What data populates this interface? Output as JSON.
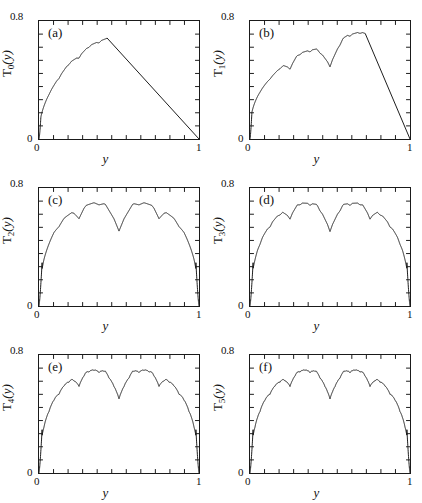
{
  "figure": {
    "width": 422,
    "height": 503,
    "background": "#ffffff",
    "line_color": "#1a1a1a",
    "rows": 3,
    "cols": 2
  },
  "chart_data": [
    {
      "type": "line",
      "panel_tag": "(a)",
      "title": "",
      "xlabel": "y",
      "ylabel": "T_0(y)",
      "ylabel_base": "T",
      "ylabel_sub": "0",
      "ylabel_suffix": "(y)",
      "xlim": [
        0,
        1
      ],
      "ylim": [
        0,
        0.8
      ],
      "xticklabels": [
        "0",
        "1"
      ],
      "yticklabels": [
        "0.8",
        "0"
      ],
      "xtick_count": 11,
      "ytick_count": 9,
      "grid": false,
      "legend": null,
      "description": "Takagi-type fractal, iteration 0: rough rising edge peaking near y=0.42 at ~0.69 then straight descent to 0 at y=1",
      "x": [
        0.0,
        0.005,
        0.01,
        0.015,
        0.02,
        0.025,
        0.03,
        0.04,
        0.05,
        0.06,
        0.07,
        0.08,
        0.09,
        0.1,
        0.11,
        0.12,
        0.13,
        0.14,
        0.15,
        0.16,
        0.17,
        0.18,
        0.19,
        0.2,
        0.21,
        0.22,
        0.23,
        0.24,
        0.25,
        0.26,
        0.27,
        0.28,
        0.29,
        0.3,
        0.31,
        0.32,
        0.33,
        0.34,
        0.35,
        0.36,
        0.37,
        0.38,
        0.39,
        0.4,
        0.41,
        0.42,
        0.43,
        0.44,
        0.45,
        0.5,
        0.55,
        0.6,
        0.65,
        0.7,
        0.75,
        0.8,
        0.85,
        0.9,
        0.95,
        1.0
      ],
      "y": [
        0.0,
        0.035,
        0.062,
        0.085,
        0.104,
        0.12,
        0.134,
        0.157,
        0.176,
        0.192,
        0.206,
        0.219,
        0.23,
        0.241,
        0.251,
        0.26,
        0.269,
        0.277,
        0.285,
        0.3,
        0.312,
        0.323,
        0.333,
        0.342,
        0.351,
        0.36,
        0.368,
        0.376,
        0.383,
        0.39,
        0.398,
        0.406,
        0.414,
        0.421,
        0.4,
        0.412,
        0.425,
        0.437,
        0.448,
        0.46,
        0.474,
        0.487,
        0.5,
        0.513,
        0.523,
        0.53,
        0.526,
        0.52,
        0.514,
        0.476,
        0.438,
        0.4,
        0.362,
        0.324,
        0.286,
        0.248,
        0.19,
        0.14,
        0.072,
        0.0
      ]
    },
    {
      "type": "line",
      "panel_tag": "(b)",
      "title": "",
      "xlabel": "y",
      "ylabel": "T_1(y)",
      "ylabel_base": "T",
      "ylabel_sub": "1",
      "ylabel_suffix": "(y)",
      "xlim": [
        0,
        1
      ],
      "ylim": [
        0,
        0.8
      ],
      "xticklabels": [
        "0",
        "1"
      ],
      "yticklabels": [
        "0.8",
        "0"
      ],
      "xtick_count": 11,
      "ytick_count": 9,
      "grid": false,
      "legend": null,
      "description": "Iteration 1: two broad humps reaching ~0.69 with central notch near y=0.5; straight descent from y~0.72 to 0 at y=1",
      "x": [
        0.0,
        0.01,
        0.02,
        0.03,
        0.04,
        0.05,
        0.06,
        0.07,
        0.08,
        0.09,
        0.1,
        0.12,
        0.14,
        0.15,
        0.16,
        0.18,
        0.2,
        0.22,
        0.24,
        0.25,
        0.26,
        0.28,
        0.3,
        0.32,
        0.34,
        0.35,
        0.36,
        0.38,
        0.4,
        0.42,
        0.44,
        0.45,
        0.46,
        0.48,
        0.5,
        0.52,
        0.54,
        0.55,
        0.56,
        0.58,
        0.6,
        0.62,
        0.64,
        0.65,
        0.66,
        0.68,
        0.7,
        0.72,
        0.75,
        0.8,
        0.85,
        0.9,
        0.95,
        1.0
      ],
      "y": [
        0.0,
        0.062,
        0.104,
        0.134,
        0.157,
        0.176,
        0.192,
        0.206,
        0.219,
        0.23,
        0.241,
        0.26,
        0.277,
        0.285,
        0.3,
        0.323,
        0.342,
        0.36,
        0.376,
        0.383,
        0.39,
        0.406,
        0.421,
        0.4,
        0.425,
        0.437,
        0.448,
        0.474,
        0.5,
        0.523,
        0.53,
        0.525,
        0.52,
        0.508,
        0.5,
        0.512,
        0.524,
        0.53,
        0.527,
        0.518,
        0.5,
        0.47,
        0.44,
        0.43,
        0.442,
        0.47,
        0.5,
        0.527,
        0.53,
        0.4,
        0.3,
        0.2,
        0.1,
        0.0
      ]
    },
    {
      "type": "line",
      "panel_tag": "(c)",
      "title": "",
      "xlabel": "y",
      "ylabel": "T_2(y)",
      "ylabel_base": "T",
      "ylabel_sub": "2",
      "ylabel_suffix": "(y)",
      "xlim": [
        0,
        1
      ],
      "ylim": [
        0,
        0.8
      ],
      "xticklabels": [
        "0",
        "1"
      ],
      "yticklabels": [
        "0.8",
        "0"
      ],
      "xtick_count": 11,
      "ytick_count": 9,
      "grid": false,
      "legend": null,
      "description": "Iteration 2: symmetric dome, two main lobes peaking ~0.69, sharp central V-notch at y=0.5, small serrations on shoulders",
      "x": [],
      "y": []
    },
    {
      "type": "line",
      "panel_tag": "(d)",
      "title": "",
      "xlabel": "y",
      "ylabel": "T_3(y)",
      "ylabel_base": "T",
      "ylabel_sub": "3",
      "ylabel_suffix": "(y)",
      "xlim": [
        0,
        1
      ],
      "ylim": [
        0,
        0.8
      ],
      "xticklabels": [
        "0",
        "1"
      ],
      "yticklabels": [
        "0.8",
        "0"
      ],
      "xtick_count": 11,
      "ytick_count": 9,
      "grid": false,
      "legend": null,
      "description": "Iteration 3: symmetric dome with finer self-similar serration, central notch at y=0.5",
      "x": [],
      "y": []
    },
    {
      "type": "line",
      "panel_tag": "(e)",
      "title": "",
      "xlabel": "y",
      "ylabel": "T_4(y)",
      "ylabel_base": "T",
      "ylabel_sub": "4",
      "ylabel_suffix": "(y)",
      "xlim": [
        0,
        1
      ],
      "ylim": [
        0,
        0.8
      ],
      "xticklabels": [
        "0",
        "1"
      ],
      "yticklabels": [
        "0.8",
        "0"
      ],
      "xtick_count": 11,
      "ytick_count": 9,
      "grid": false,
      "legend": null,
      "description": "Iteration 4: converged symmetric fractal dome, peaks ~0.69, deep central notch",
      "x": [],
      "y": []
    },
    {
      "type": "line",
      "panel_tag": "(f)",
      "title": "",
      "xlabel": "y",
      "ylabel": "T_5(y)",
      "ylabel_base": "T",
      "ylabel_sub": "5",
      "ylabel_suffix": "(y)",
      "xlim": [
        0,
        1
      ],
      "ylim": [
        0,
        0.8
      ],
      "xticklabels": [
        "0",
        "1"
      ],
      "yticklabels": [
        "0.8",
        "0"
      ],
      "xtick_count": 11,
      "ytick_count": 9,
      "grid": false,
      "legend": null,
      "description": "Iteration 5: fully converged symmetric fractal dome, indistinguishable from (e)",
      "x": [],
      "y": []
    }
  ]
}
